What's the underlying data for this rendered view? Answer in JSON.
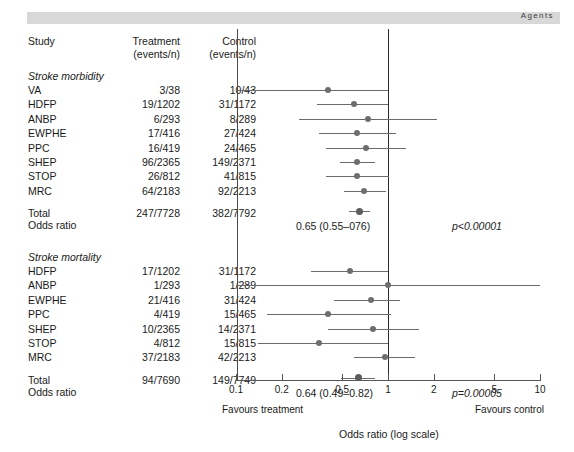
{
  "running_head": {
    "text": "Agents"
  },
  "table": {
    "headers": {
      "study": "Study",
      "treatment_l1": "Treatment",
      "treatment_l2": "(events/n)",
      "control_l1": "Control",
      "control_l2": "(events/n)"
    }
  },
  "sections": [
    {
      "title": "Stroke morbidity",
      "rows": [
        {
          "study": "VA",
          "treatment": "3/38",
          "control": "10/43"
        },
        {
          "study": "HDFP",
          "treatment": "19/1202",
          "control": "31/1172"
        },
        {
          "study": "ANBP",
          "treatment": "6/293",
          "control": "8/289"
        },
        {
          "study": "EWPHE",
          "treatment": "17/416",
          "control": "27/424"
        },
        {
          "study": "PPC",
          "treatment": "16/419",
          "control": "24/465"
        },
        {
          "study": "SHEP",
          "treatment": "96/2365",
          "control": "149/2371"
        },
        {
          "study": "STOP",
          "treatment": "26/812",
          "control": "41/815"
        },
        {
          "study": "MRC",
          "treatment": "64/2183",
          "control": "92/2213"
        }
      ],
      "total": {
        "label": "Total",
        "treatment": "247/7728",
        "control": "382/7792"
      },
      "summary_label": "Odds ratio",
      "summary_text": "0.65 (0.55–076)",
      "p_text": "p<0.00001"
    },
    {
      "title": "Stroke mortality",
      "rows": [
        {
          "study": "HDFP",
          "treatment": "17/1202",
          "control": "31/1172"
        },
        {
          "study": "ANBP",
          "treatment": "1/293",
          "control": "1/289"
        },
        {
          "study": "EWPHE",
          "treatment": "21/416",
          "control": "31/424"
        },
        {
          "study": "PPC",
          "treatment": "4/419",
          "control": "15/465"
        },
        {
          "study": "SHEP",
          "treatment": "10/2365",
          "control": "14/2371"
        },
        {
          "study": "STOP",
          "treatment": "4/812",
          "control": "15/815"
        },
        {
          "study": "MRC",
          "treatment": "37/2183",
          "control": "42/2213"
        }
      ],
      "total": {
        "label": "Total",
        "treatment": "94/7690",
        "control": "149/7749"
      },
      "summary_label": "Odds ratio",
      "summary_text": "0.64 (0.49–0.82)",
      "p_text": "p=0.00005"
    }
  ],
  "axis": {
    "ticks": [
      "0.1",
      "0.2",
      "0.5",
      "1",
      "2",
      "5",
      "10"
    ],
    "favours_left": "Favours treatment",
    "favours_right": "Favours control",
    "caption": "Odds ratio (log scale)"
  },
  "colors": {
    "headband": "#d8d8d8",
    "marker": "#6e6e6e",
    "ci_line": "#6b6b6b",
    "null_line": "#2a2a2a",
    "axis": "#555555",
    "text": "#1a1a1a"
  },
  "chart_data": {
    "type": "scatter",
    "xlabel": "Odds ratio (log scale)",
    "ylabel": "",
    "xscale": "log",
    "xlim": [
      0.1,
      10
    ],
    "xticks": [
      0.1,
      0.2,
      0.5,
      1,
      2,
      5,
      10
    ],
    "null_value": 1,
    "grid": false,
    "legend": "none",
    "groups": [
      {
        "name": "Stroke morbidity",
        "points": [
          {
            "study": "VA",
            "or": 0.4,
            "ci_low": 0.1,
            "ci_high": 1.0,
            "treatment": "3/38",
            "control": "10/43"
          },
          {
            "study": "HDFP",
            "or": 0.6,
            "ci_low": 0.34,
            "ci_high": 1.0,
            "treatment": "19/1202",
            "control": "31/1172"
          },
          {
            "study": "ANBP",
            "or": 0.74,
            "ci_low": 0.26,
            "ci_high": 2.1,
            "treatment": "6/293",
            "control": "8/289"
          },
          {
            "study": "EWPHE",
            "or": 0.63,
            "ci_low": 0.35,
            "ci_high": 1.13,
            "treatment": "17/416",
            "control": "27/424"
          },
          {
            "study": "PPC",
            "or": 0.72,
            "ci_low": 0.39,
            "ci_high": 1.32,
            "treatment": "16/419",
            "control": "24/465"
          },
          {
            "study": "SHEP",
            "or": 0.63,
            "ci_low": 0.48,
            "ci_high": 0.82,
            "treatment": "96/2365",
            "control": "149/2371"
          },
          {
            "study": "STOP",
            "or": 0.63,
            "ci_low": 0.39,
            "ci_high": 1.02,
            "treatment": "26/812",
            "control": "41/815"
          },
          {
            "study": "MRC",
            "or": 0.7,
            "ci_low": 0.51,
            "ci_high": 0.97,
            "treatment": "64/2183",
            "control": "92/2213"
          }
        ],
        "summary": {
          "or": 0.65,
          "ci_low": 0.55,
          "ci_high": 0.76,
          "label": "0.65 (0.55–076)",
          "p": "p<0.00001",
          "treatment": "247/7728",
          "control": "382/7792"
        }
      },
      {
        "name": "Stroke mortality",
        "points": [
          {
            "study": "HDFP",
            "or": 0.56,
            "ci_low": 0.31,
            "ci_high": 1.0,
            "treatment": "17/1202",
            "control": "31/1172"
          },
          {
            "study": "ANBP",
            "or": 1.0,
            "ci_low": 0.1,
            "ci_high": 10.0,
            "treatment": "1/293",
            "control": "1/289"
          },
          {
            "study": "EWPHE",
            "or": 0.77,
            "ci_low": 0.44,
            "ci_high": 1.2,
            "treatment": "21/416",
            "control": "31/424"
          },
          {
            "study": "PPC",
            "or": 0.4,
            "ci_low": 0.16,
            "ci_high": 1.05,
            "treatment": "4/419",
            "control": "15/465"
          },
          {
            "study": "SHEP",
            "or": 0.8,
            "ci_low": 0.4,
            "ci_high": 1.6,
            "treatment": "10/2365",
            "control": "14/2371"
          },
          {
            "study": "STOP",
            "or": 0.35,
            "ci_low": 0.14,
            "ci_high": 1.0,
            "treatment": "4/812",
            "control": "15/815"
          },
          {
            "study": "MRC",
            "or": 0.96,
            "ci_low": 0.6,
            "ci_high": 1.5,
            "treatment": "37/2183",
            "control": "42/2213"
          }
        ],
        "summary": {
          "or": 0.64,
          "ci_low": 0.49,
          "ci_high": 0.82,
          "label": "0.64 (0.49–0.82)",
          "p": "p=0.00005",
          "treatment": "94/7690",
          "control": "149/7749"
        }
      }
    ]
  }
}
